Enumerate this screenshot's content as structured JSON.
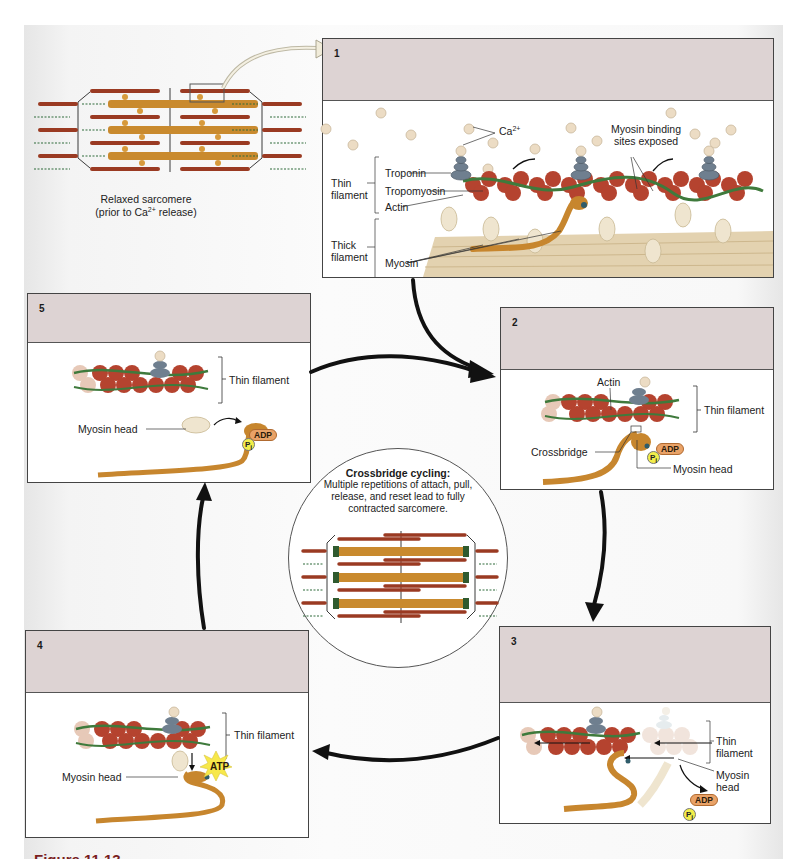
{
  "figure": {
    "caption_partial": "Figure 11.13",
    "colors": {
      "panel_header": "#ddd3d3",
      "actin": "#b5432f",
      "tropomyosin": "#3f7a3c",
      "troponin": "#6f7f8f",
      "myosin_active": "#c7862e",
      "myosin_inactive": "#e8dcc0",
      "calcium": "#ecdcc4",
      "adp_badge": "#e9a267",
      "pi_badge": "#f2ee4a",
      "atp_burst": "#f7e84a",
      "arrow": "#111111",
      "caption": "#7a1f1f"
    }
  },
  "relaxed_sarcomere": {
    "label_line1": "Relaxed sarcomere",
    "label_line2_pre": "(prior to Ca",
    "label_line2_sup": "2+",
    "label_line2_post": " release)"
  },
  "panels": [
    {
      "id": 1,
      "number": "1",
      "labels": {
        "ca": "Ca",
        "ca_sup": "2+",
        "binding_sites_1": "Myosin binding",
        "binding_sites_2": "sites exposed",
        "thin_filament_1": "Thin",
        "thin_filament_2": "filament",
        "troponin": "Troponin",
        "tropomyosin": "Tropomyosin",
        "actin": "Actin",
        "thick_filament_1": "Thick",
        "thick_filament_2": "filament",
        "myosin": "Myosin"
      }
    },
    {
      "id": 2,
      "number": "2",
      "labels": {
        "actin": "Actin",
        "thin_filament": "Thin filament",
        "crossbridge": "Crossbridge",
        "myosin_head": "Myosin head",
        "adp": "ADP",
        "pi": "P",
        "pi_sub": "i"
      }
    },
    {
      "id": 3,
      "number": "3",
      "labels": {
        "thin_filament_1": "Thin",
        "thin_filament_2": "filament",
        "myosin_head_1": "Myosin",
        "myosin_head_2": "head",
        "adp": "ADP",
        "pi": "P",
        "pi_sub": "i"
      }
    },
    {
      "id": 4,
      "number": "4",
      "labels": {
        "thin_filament": "Thin filament",
        "myosin_head": "Myosin head",
        "atp": "ATP"
      }
    },
    {
      "id": 5,
      "number": "5",
      "labels": {
        "thin_filament": "Thin filament",
        "myosin_head": "Myosin head",
        "adp": "ADP",
        "pi": "P",
        "pi_sub": "i"
      }
    }
  ],
  "center_circle": {
    "title": "Crossbridge cycling:",
    "description": "Multiple repetitions of attach, pull, release, and reset lead to fully contracted sarcomere."
  },
  "cycle_flow": [
    "1 → 2",
    "2 → 3",
    "3 → 4",
    "4 → 5",
    "5 → 2"
  ]
}
